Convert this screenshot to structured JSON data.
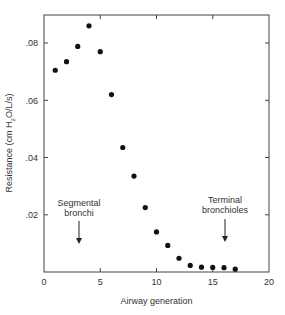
{
  "chart_data": {
    "type": "scatter",
    "title": "",
    "xlabel": "Airway generation",
    "ylabel": "Resistance (cm H2O/L/s)",
    "xlim": [
      0,
      20
    ],
    "ylim": [
      0,
      0.09
    ],
    "x_ticks": [
      "0",
      "5",
      "10",
      "15",
      "20"
    ],
    "y_ticks": [
      ".02",
      ".04",
      ".06",
      ".08"
    ],
    "grid": false,
    "series": [
      {
        "name": "Resistance",
        "x": [
          1,
          2,
          3,
          4,
          5,
          6,
          7,
          8,
          9,
          10,
          11,
          12,
          13,
          14,
          15,
          16,
          17
        ],
        "y": [
          0.0705,
          0.0735,
          0.0788,
          0.086,
          0.077,
          0.062,
          0.0435,
          0.0335,
          0.0225,
          0.014,
          0.0093,
          0.0048,
          0.0023,
          0.0017,
          0.0016,
          0.0015,
          0.001
        ]
      }
    ],
    "annotations": [
      {
        "text_line1": "Segmental",
        "text_line2": "bronchi",
        "x": 3
      },
      {
        "text_line1": "Terminal",
        "text_line2": "bronchioles",
        "x": 16
      }
    ]
  },
  "labels": {
    "xlabel": "Airway generation",
    "ylabel_pre": "Resistance (cm H",
    "ylabel_sub": "2",
    "ylabel_post": "O/L/s)",
    "ann1_l1": "Segmental",
    "ann1_l2": "bronchi",
    "ann2_l1": "Terminal",
    "ann2_l2": "bronchioles",
    "x0": "0",
    "x5": "5",
    "x10": "10",
    "x15": "15",
    "x20": "20",
    "y02": ".02",
    "y04": ".04",
    "y06": ".06",
    "y08": ".08"
  }
}
